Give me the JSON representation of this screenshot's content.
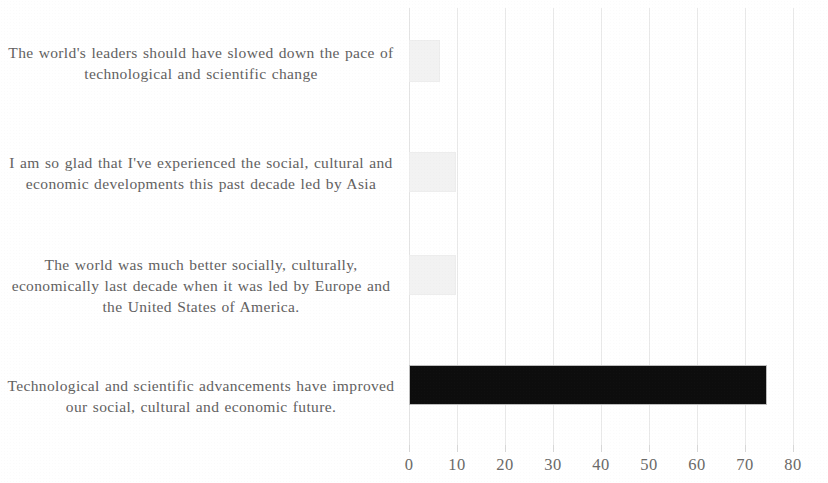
{
  "chart_data": {
    "type": "bar",
    "orientation": "horizontal",
    "title": "",
    "subtitle": "",
    "xlabel": "",
    "ylabel": "",
    "xlim": [
      0,
      80
    ],
    "xtick_step": 10,
    "grid": true,
    "legend": "none",
    "tick_labels": [
      "0",
      "10",
      "20",
      "30",
      "40",
      "50",
      "60",
      "70",
      "80"
    ],
    "tick_values": [
      0,
      10,
      20,
      30,
      40,
      50,
      60,
      70,
      80
    ],
    "categories": [
      "The world's leaders should have slowed down the pace of technological and scientific change",
      "I am so glad that I've experienced the social, cultural and economic developments this past decade led by Asia",
      "The world was much better socially, culturally, economically last decade when it was led by Europe and the United States of America.",
      "Technological and scientific advancements have improved our social, cultural and economic future."
    ],
    "values": [
      6.5,
      9.8,
      9.7,
      74.5
    ],
    "bar_colors": [
      "#f2f2f2",
      "#f2f2f2",
      "#f2f2f2",
      "#0d0d0d"
    ]
  },
  "colors": {
    "bar_light": "#f2f2f2",
    "bar_dark": "#0d0d0d",
    "gridline": "#e9e9e9",
    "text": "#62615f",
    "background": "#ffffff"
  }
}
